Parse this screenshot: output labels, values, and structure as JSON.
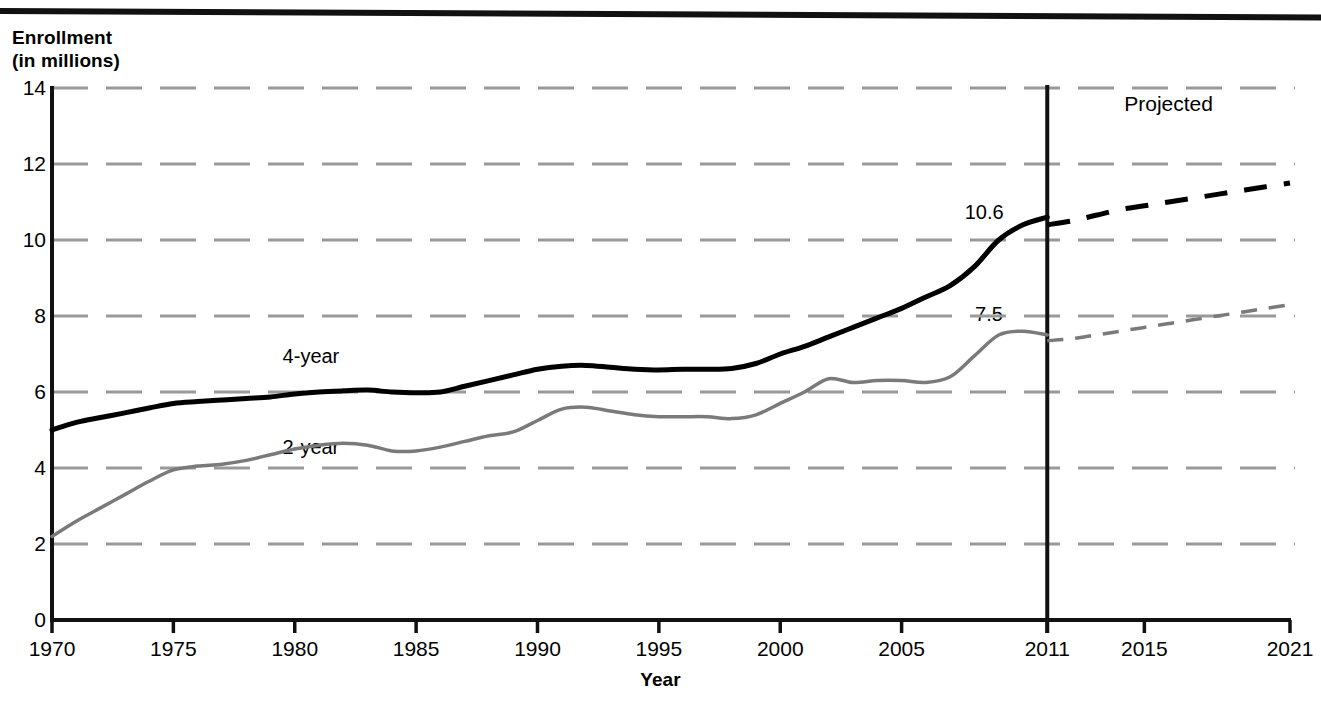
{
  "chart_data": {
    "type": "line",
    "title": "",
    "ylabel_line1": "Enrollment",
    "ylabel_line2": "(in millions)",
    "xlabel": "Year",
    "ylim": [
      0,
      14
    ],
    "xlim": [
      1970,
      2021
    ],
    "grid": true,
    "grid_style": "dashed-horizontal",
    "legend_position": "inline-annotation",
    "yticks": [
      0,
      2,
      4,
      6,
      8,
      10,
      12,
      14
    ],
    "ytick_labels": [
      "0",
      "2",
      "4",
      "6",
      "8",
      "10",
      "12",
      "14"
    ],
    "xticks": [
      1970,
      1975,
      1980,
      1985,
      1990,
      1995,
      2000,
      2005,
      2011,
      2015,
      2021
    ],
    "xtick_labels": [
      "1970",
      "1975",
      "1980",
      "1985",
      "1990",
      "1995",
      "2000",
      "2005",
      "2011",
      "2015",
      "2021"
    ],
    "projection_divider_x": 2011,
    "annotations": [
      {
        "text": "Projected",
        "x": 2016,
        "y": 13.6
      },
      {
        "text": "4-year",
        "x": 1979.5,
        "y": 6.95
      },
      {
        "text": "2-year",
        "x": 1979.5,
        "y": 4.55
      },
      {
        "text": "10.6",
        "x": 2008.4,
        "y": 10.75
      },
      {
        "text": "7.5",
        "x": 2008.6,
        "y": 8.05
      }
    ],
    "series": [
      {
        "name": "4-year",
        "color": "#000000",
        "width": 5,
        "actual_x": [
          1970,
          1971,
          1972,
          1973,
          1974,
          1975,
          1976,
          1977,
          1978,
          1979,
          1980,
          1981,
          1982,
          1983,
          1984,
          1985,
          1986,
          1987,
          1988,
          1989,
          1990,
          1991,
          1992,
          1993,
          1994,
          1995,
          1996,
          1997,
          1998,
          1999,
          2000,
          2001,
          2002,
          2003,
          2004,
          2005,
          2006,
          2007,
          2008,
          2009,
          2010,
          2011
        ],
        "actual_y": [
          5.0,
          5.2,
          5.33,
          5.45,
          5.58,
          5.7,
          5.75,
          5.79,
          5.83,
          5.87,
          5.95,
          6.0,
          6.03,
          6.05,
          6.0,
          5.98,
          6.0,
          6.15,
          6.3,
          6.45,
          6.6,
          6.68,
          6.7,
          6.65,
          6.6,
          6.58,
          6.6,
          6.6,
          6.62,
          6.75,
          7.0,
          7.2,
          7.45,
          7.7,
          7.95,
          8.2,
          8.5,
          8.8,
          9.3,
          10.0,
          10.4,
          10.6
        ],
        "projected_x": [
          2011,
          2012,
          2013,
          2014,
          2015,
          2016,
          2017,
          2018,
          2019,
          2020,
          2021
        ],
        "projected_y": [
          10.4,
          10.5,
          10.65,
          10.8,
          10.9,
          11.0,
          11.1,
          11.2,
          11.3,
          11.4,
          11.5
        ],
        "label_value_2011": "10.6"
      },
      {
        "name": "2-year",
        "color": "#7a7a7a",
        "width": 3.5,
        "actual_x": [
          1970,
          1971,
          1972,
          1973,
          1974,
          1975,
          1976,
          1977,
          1978,
          1979,
          1980,
          1981,
          1982,
          1983,
          1984,
          1985,
          1986,
          1987,
          1988,
          1989,
          1990,
          1991,
          1992,
          1993,
          1994,
          1995,
          1996,
          1997,
          1998,
          1999,
          2000,
          2001,
          2002,
          2003,
          2004,
          2005,
          2006,
          2007,
          2008,
          2009,
          2010,
          2011
        ],
        "actual_y": [
          2.2,
          2.6,
          2.95,
          3.3,
          3.65,
          3.95,
          4.05,
          4.1,
          4.2,
          4.35,
          4.5,
          4.6,
          4.65,
          4.6,
          4.45,
          4.45,
          4.55,
          4.7,
          4.85,
          4.95,
          5.25,
          5.55,
          5.6,
          5.5,
          5.4,
          5.35,
          5.35,
          5.35,
          5.3,
          5.4,
          5.7,
          6.0,
          6.35,
          6.25,
          6.3,
          6.3,
          6.25,
          6.4,
          6.95,
          7.5,
          7.6,
          7.5
        ],
        "projected_x": [
          2011,
          2012,
          2013,
          2014,
          2015,
          2016,
          2017,
          2018,
          2019,
          2020,
          2021
        ],
        "projected_y": [
          7.35,
          7.4,
          7.5,
          7.6,
          7.7,
          7.8,
          7.9,
          8.0,
          8.1,
          8.2,
          8.3
        ],
        "label_value_2011": "7.5"
      }
    ]
  },
  "axes": {
    "y_title_line1": "Enrollment",
    "y_title_line2": "(in millions)",
    "x_title": "Year"
  },
  "colors": {
    "axis": "#111111",
    "grid": "#9a9a9a",
    "series_4year": "#000000",
    "series_2year": "#7a7a7a",
    "background": "#ffffff"
  }
}
